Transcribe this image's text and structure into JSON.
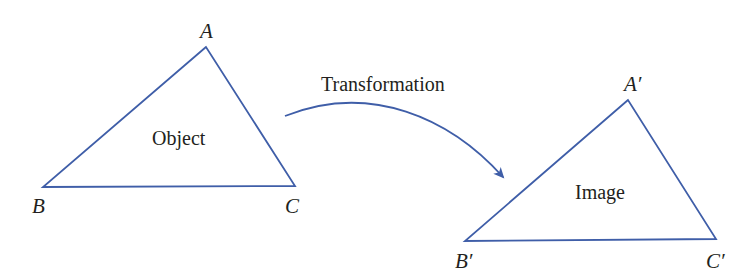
{
  "colors": {
    "line": "#3f5ea8",
    "text": "#231f20",
    "background": "#ffffff"
  },
  "object": {
    "label": "Object",
    "vertices": {
      "A": "A",
      "B": "B",
      "C": "C"
    },
    "points": "206,47 43,187 295,186"
  },
  "image": {
    "label": "Image",
    "vertices": {
      "A": "A′",
      "B": "B′",
      "C": "C′"
    },
    "points": "628,100 465,241 716,239"
  },
  "transformation": {
    "label": "Transformation",
    "path": "M285,116 C 370,82 450,118 503,177"
  }
}
